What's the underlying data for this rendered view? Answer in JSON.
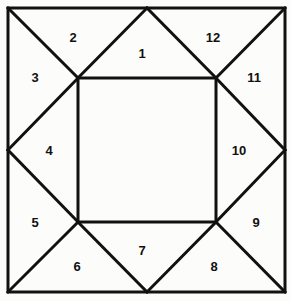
{
  "figure": {
    "colors": {
      "background": "#fcfcfa",
      "stroke": "#111111",
      "fill": "#fcfcfa",
      "label": "#111111"
    },
    "stroke_width": 3,
    "outer_square": {
      "left": 8,
      "top": 8,
      "right": 285,
      "bottom": 292
    },
    "inner_square": {
      "left": 78,
      "top": 78,
      "right": 216,
      "bottom": 222
    },
    "edge_midpoints": {
      "top": [
        147,
        8
      ],
      "left": [
        8,
        150
      ],
      "right": [
        285,
        150
      ],
      "bottom": [
        147,
        292
      ]
    },
    "labels": [
      {
        "text": "1",
        "x": 142,
        "y": 53
      },
      {
        "text": "2",
        "x": 73,
        "y": 37
      },
      {
        "text": "3",
        "x": 35,
        "y": 77
      },
      {
        "text": "4",
        "x": 49,
        "y": 150
      },
      {
        "text": "5",
        "x": 35,
        "y": 222
      },
      {
        "text": "6",
        "x": 77,
        "y": 266
      },
      {
        "text": "7",
        "x": 142,
        "y": 250
      },
      {
        "text": "8",
        "x": 214,
        "y": 266
      },
      {
        "text": "9",
        "x": 256,
        "y": 222
      },
      {
        "text": "10",
        "x": 239,
        "y": 150
      },
      {
        "text": "11",
        "x": 254,
        "y": 77
      },
      {
        "text": "12",
        "x": 213,
        "y": 37
      }
    ],
    "lines": [
      {
        "name": "outer-square-path",
        "d": "M 8 8 L 285 8 L 285 292 L 8 292 Z"
      },
      {
        "name": "inner-square-path",
        "d": "M 78 78 L 216 78 L 216 222 L 78 222 Z"
      },
      {
        "name": "corner-diagonal-top-left",
        "d": "M 8 8 L 78 78"
      },
      {
        "name": "corner-diagonal-top-right",
        "d": "M 285 8 L 216 78"
      },
      {
        "name": "corner-diagonal-bottom-right",
        "d": "M 285 292 L 216 222"
      },
      {
        "name": "corner-diagonal-bottom-left",
        "d": "M 8 292 L 78 222"
      },
      {
        "name": "apex-top-left-ray",
        "d": "M 147 8 L 78 78"
      },
      {
        "name": "apex-top-right-ray",
        "d": "M 147 8 L 216 78"
      },
      {
        "name": "apex-left-top-ray",
        "d": "M 8 150 L 78 78"
      },
      {
        "name": "apex-left-bottom-ray",
        "d": "M 8 150 L 78 222"
      },
      {
        "name": "apex-right-top-ray",
        "d": "M 285 150 L 216 78"
      },
      {
        "name": "apex-right-bottom-ray",
        "d": "M 285 150 L 216 222"
      },
      {
        "name": "apex-bottom-left-ray",
        "d": "M 147 292 L 78 222"
      },
      {
        "name": "apex-bottom-right-ray",
        "d": "M 147 292 L 216 222"
      }
    ]
  }
}
